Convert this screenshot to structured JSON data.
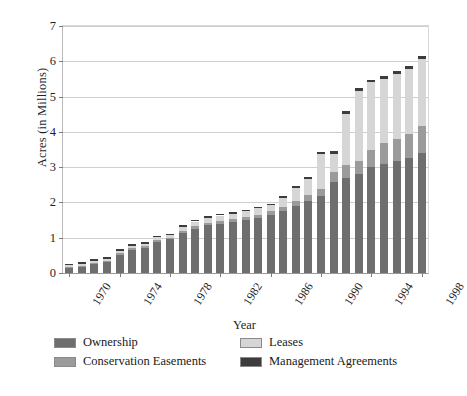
{
  "chart_data": {
    "type": "bar",
    "subtype": "stacked-vertical",
    "title": "",
    "xlabel": "Year",
    "ylabel": "Acres (in Millions)",
    "ylim": [
      0,
      7
    ],
    "ytick_labels": [
      "0",
      "1",
      "2",
      "3",
      "4",
      "5",
      "6",
      "7"
    ],
    "ytick_values": [
      0,
      1,
      2,
      3,
      4,
      5,
      6,
      7
    ],
    "xtick_labels": [
      "1970",
      "1974",
      "1978",
      "1982",
      "1986",
      "1990",
      "1994",
      "1998"
    ],
    "xtick_years": [
      1970,
      1974,
      1978,
      1982,
      1986,
      1990,
      1994,
      1998
    ],
    "grid": "horizontal",
    "legend_position": "below-axes",
    "categories": [
      "1970",
      "1971",
      "1972",
      "1973",
      "1974",
      "1975",
      "1976",
      "1977",
      "1978",
      "1979",
      "1980",
      "1981",
      "1982",
      "1983",
      "1984",
      "1985",
      "1986",
      "1987",
      "1988",
      "1989",
      "1990",
      "1991",
      "1992",
      "1993",
      "1994",
      "1995",
      "1996",
      "1997",
      "1998"
    ],
    "series": [
      {
        "name": "Ownership",
        "color": "#6e6e6e",
        "values": [
          0.15,
          0.18,
          0.26,
          0.3,
          0.52,
          0.65,
          0.72,
          0.88,
          0.95,
          1.12,
          1.25,
          1.35,
          1.4,
          1.45,
          1.5,
          1.56,
          1.65,
          1.75,
          1.9,
          2.05,
          2.18,
          2.58,
          2.7,
          2.8,
          3.0,
          3.1,
          3.18,
          3.25,
          3.4
        ]
      },
      {
        "name": "Conservation Easements",
        "color": "#9b9b9b",
        "values": [
          0.02,
          0.02,
          0.02,
          0.03,
          0.05,
          0.05,
          0.05,
          0.05,
          0.05,
          0.06,
          0.07,
          0.08,
          0.08,
          0.08,
          0.09,
          0.09,
          0.1,
          0.11,
          0.14,
          0.16,
          0.2,
          0.28,
          0.35,
          0.38,
          0.5,
          0.58,
          0.62,
          0.68,
          0.76
        ]
      },
      {
        "name": "Leases",
        "color": "#d6d6d6",
        "values": [
          0.05,
          0.06,
          0.06,
          0.07,
          0.06,
          0.06,
          0.06,
          0.08,
          0.07,
          0.12,
          0.14,
          0.14,
          0.15,
          0.15,
          0.16,
          0.18,
          0.17,
          0.26,
          0.38,
          0.45,
          0.98,
          0.52,
          1.45,
          1.98,
          1.9,
          1.83,
          1.85,
          1.85,
          1.9
        ]
      },
      {
        "name": "Management Agreements",
        "color": "#3c3c3c",
        "values": [
          0.05,
          0.05,
          0.05,
          0.05,
          0.05,
          0.05,
          0.05,
          0.05,
          0.05,
          0.05,
          0.05,
          0.05,
          0.05,
          0.05,
          0.05,
          0.05,
          0.05,
          0.06,
          0.06,
          0.07,
          0.07,
          0.08,
          0.08,
          0.08,
          0.08,
          0.08,
          0.08,
          0.08,
          0.09
        ]
      }
    ],
    "totals": [
      0.27,
      0.31,
      0.39,
      0.45,
      0.68,
      0.81,
      0.88,
      1.06,
      1.12,
      1.35,
      1.51,
      1.62,
      1.68,
      1.73,
      1.8,
      1.88,
      1.97,
      2.18,
      2.48,
      2.73,
      3.43,
      3.46,
      4.58,
      5.24,
      5.48,
      5.59,
      5.73,
      5.86,
      6.15
    ]
  },
  "legend": {
    "items": [
      {
        "label": "Ownership",
        "color": "#6e6e6e"
      },
      {
        "label": "Leases",
        "color": "#d6d6d6"
      },
      {
        "label": "Conservation Easements",
        "color": "#9b9b9b"
      },
      {
        "label": "Management Agreements",
        "color": "#3c3c3c"
      }
    ]
  }
}
